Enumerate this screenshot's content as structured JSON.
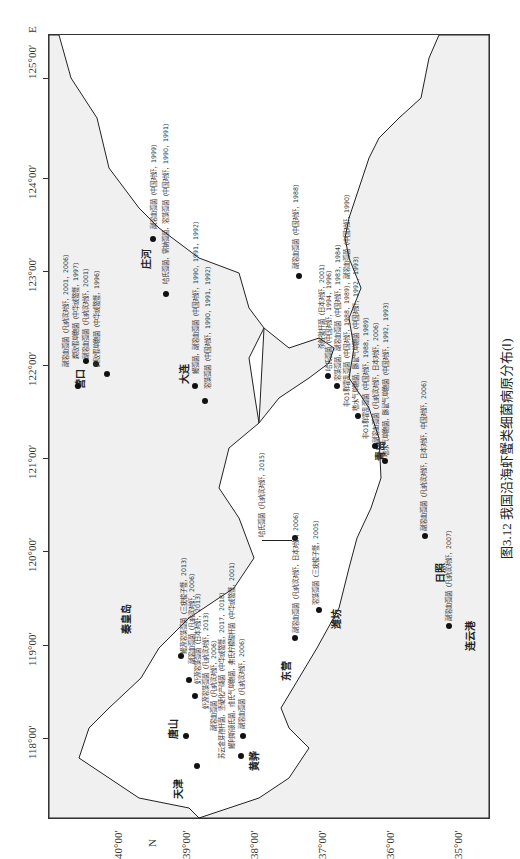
{
  "caption": "图3.12  我国沿海虾蟹类细菌病原分布(Ⅰ)",
  "axes": {
    "x_label": "E",
    "y_label": "N",
    "x_ticks": [
      "118°00′",
      "119°00′",
      "120°00′",
      "121°00′",
      "122°00′",
      "123°00′",
      "124°00′",
      "125°00′"
    ],
    "y_ticks": [
      "40°00′",
      "39°00′",
      "38°00′",
      "37°00′",
      "36°00′",
      "35°00′"
    ]
  },
  "places": {
    "tianjin": "天津",
    "tangshan": "唐山",
    "qinhuangdao": "秦皇岛",
    "huanghua": "黄骅",
    "dongying": "东营",
    "weifang": "潍坊",
    "qingdao": "青岛",
    "rizhao": "日照",
    "lianyungang": "连云港",
    "yingkou": "营口",
    "zhuanghe": "庄河",
    "dalian": "大连"
  },
  "sites": {
    "yingkou_1": "副溶血弧菌（凡纳滨对虾，2001，2006）",
    "yingkou_2": "腐败假单胞菌（中华绒螯蟹，1997）",
    "yingkou_3": "副溶血弧菌（凡纳滨对虾，2001）",
    "yingkou_4": "腐败假单胞菌（中华绒螯蟹，1996）",
    "zhuanghe_1": "副溶血弧菌（中国对虾，1999）",
    "zhuanghe_2": "哈氏弧菌，需钠弧菌，溶藻弧菌（中国对虾，1990，1991）",
    "dalian_1": "鳗弧菌，副溶血弧菌（中国对虾，1990，1991，1992）",
    "dalian_2": "溶藻弧菌（中国对虾，1990，1991，1992）",
    "qhd_1": "鳗源溶藻弧菌（三疣梭子蟹，2013）",
    "qhd_2": "副溶血弧菌（凡纳滨对虾，2006）",
    "ts_1": "虾源溶藻弧菌（日本对虾，2013）",
    "ts_2": "虾源溶藻弧菌（凡纳滨对虾，2013）",
    "ts_3": "副溶血弧菌（凡纳滨对虾，2006）",
    "hh_1": "苏云金芽孢杆菌，坚硬化产碱菌（中华绒螯蟹，2017，2018）",
    "hh_2": "鳗利斯顿氏菌，维氏气单胞菌，弗氏柠檬酸杆菌（中华绒螯蟹，2001）",
    "hh_3": "副溶血弧菌（凡纳滨对虾，2006）",
    "dy_1": "哈氏弧菌（凡纳滨对虾，2015）",
    "dy_2": "副溶血弧菌（凡纳滨对虾，日本对虾，2006）",
    "wf_1": "溶藻弧菌（三疣梭子蟹，2005）",
    "sd_1": "副溶血弧菌（中国对虾，1988）",
    "sd_2": "杀鲑微杆菌（日本对虾，2001）",
    "sd_3": "哈氏弧菌（中国对虾，1994，1996）",
    "sd_4": "溶藻弧菌，副溶血弧菌（中国对虾，1983，1984）",
    "qd_1": "非O1群霍乱弧菌（中国对虾，1988，1989），副溶血弧菌（中国对虾，1990）",
    "qd_2": "嗜水气单胞菌，豚鼠气单胞菌（中国对虾，1992，1993）",
    "qd_3": "非O1群霍乱弧菌（中国对虾，1988，1989）",
    "qd_4": "副溶血弧菌（凡纳滨对虾，日本对虾，2006）",
    "qd_5": "嗜水气单胞菌，豚鼠气单胞菌（中国对虾，1992，1993）",
    "rz_1": "副溶血弧菌（凡纳滨对虾，日本对虾，中国对虾，2006）",
    "lyg_1": "副溶血弧菌（凡纳滨对虾，2007）"
  }
}
